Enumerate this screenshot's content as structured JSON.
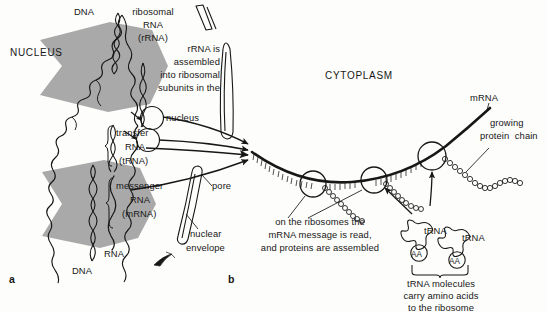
{
  "figure": {
    "panel_a_label": "a",
    "panel_b_label": "b",
    "ink_color": "#171717",
    "arrow_fill_color": "#a9a9a9",
    "background_color": "#fdfdfb"
  },
  "compartments": {
    "nucleus": "NUCLEUS",
    "cytoplasm": "CYTOPLASM"
  },
  "nucleus_labels": {
    "dna_top": "DNA",
    "dna_bottom": "DNA",
    "rna": "RNA"
  },
  "rna_types": [
    {
      "line1": "ribosomal",
      "line2": "RNA",
      "line3": "(rRNA)"
    },
    {
      "line1": "transfer",
      "line2": "RNA",
      "line3": "(tRNA)"
    },
    {
      "line1": "messenger",
      "line2": "RNA",
      "line3": "(mRNA)"
    }
  ],
  "annotations": {
    "rrna_assembly": [
      "rRNA is",
      "assembled",
      "into ribosomal",
      "subunits in the",
      "nucleus"
    ],
    "ribosome_note": [
      "on the ribosomes the",
      "mRNA message is read,",
      "and proteins are assembled"
    ],
    "trna_note": [
      "tRNA molecules",
      "carry amino acids",
      "to the ribosome"
    ]
  },
  "membrane_labels": {
    "pore": "pore",
    "nuclear_envelope_line1": "nuclear",
    "nuclear_envelope_line2": "envelope"
  },
  "cytoplasm_labels": {
    "mrna": "mRNA",
    "growing_protein_line1": "growing",
    "growing_protein_line2": "protein  chain"
  },
  "trna_molecules": [
    {
      "name": "tRNA",
      "cargo": "AA"
    },
    {
      "name": "tRNA",
      "cargo": "AA"
    }
  ]
}
